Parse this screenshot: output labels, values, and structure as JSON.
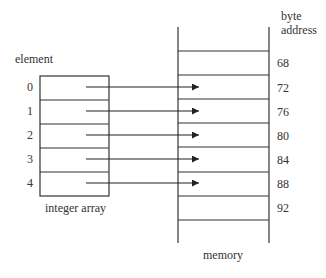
{
  "labels": {
    "element": "element",
    "integer_array": "integer array",
    "memory": "memory",
    "byte": "byte",
    "address": "address"
  },
  "elements": [
    "0",
    "1",
    "2",
    "3",
    "4"
  ],
  "addresses": [
    "68",
    "72",
    "76",
    "80",
    "84",
    "88",
    "92"
  ],
  "mapping": [
    {
      "element": "0",
      "address": "72"
    },
    {
      "element": "1",
      "address": "76"
    },
    {
      "element": "2",
      "address": "80"
    },
    {
      "element": "3",
      "address": "84"
    },
    {
      "element": "4",
      "address": "88"
    }
  ]
}
